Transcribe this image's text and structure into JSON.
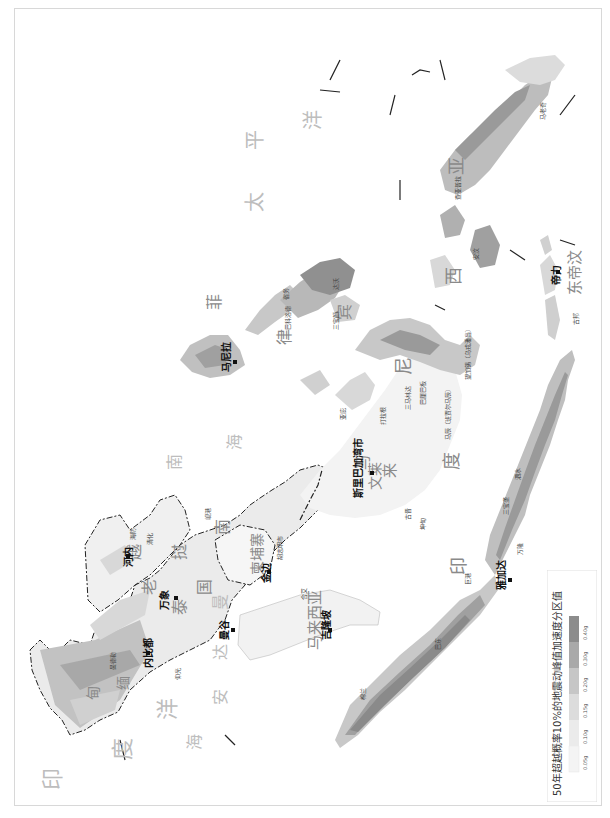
{
  "map": {
    "title": "50年超越概率10%的地震动峰值加速度分区值",
    "orientation": "rotated 90° counter-clockwise",
    "oceans": {
      "pacific": [
        "太",
        "平",
        "洋"
      ],
      "indian": [
        "印",
        "度",
        "洋"
      ],
      "andaman": [
        "安",
        "达",
        "曼",
        "海"
      ],
      "south_china_sea": [
        "南",
        "海"
      ]
    },
    "countries": {
      "vietnam": [
        "越",
        "南"
      ],
      "laos": [
        "老",
        "挝"
      ],
      "thailand": [
        "泰",
        "国"
      ],
      "cambodia": "柬埔寨",
      "myanmar": [
        "缅",
        "甸"
      ],
      "malaysia": "马来西亚",
      "brunei": "文莱",
      "philippines": [
        "菲",
        "律",
        "宾"
      ],
      "indonesia": [
        "印",
        "度",
        "尼",
        "西",
        "亚"
      ],
      "east_timor": "东帝汶",
      "malaysia_borneo": [
        "马",
        "来"
      ]
    },
    "capitals": [
      {
        "name": "内比都"
      },
      {
        "name": "河内"
      },
      {
        "name": "万象"
      },
      {
        "name": "曼谷"
      },
      {
        "name": "金边"
      },
      {
        "name": "吉隆坡"
      },
      {
        "name": "斯里巴加湾市"
      },
      {
        "name": "马尼拉"
      },
      {
        "name": "雅加达"
      },
      {
        "name": "帝力"
      }
    ],
    "cities": [
      {
        "name": "曼德勒"
      },
      {
        "name": "仰光"
      },
      {
        "name": "海防"
      },
      {
        "name": "清化"
      },
      {
        "name": "岘港"
      },
      {
        "name": "胡志明市"
      },
      {
        "name": "合艾"
      },
      {
        "name": "古晋"
      },
      {
        "name": "棉兰"
      },
      {
        "name": "巴东"
      },
      {
        "name": "巨港"
      },
      {
        "name": "泗水"
      },
      {
        "name": "三宝垄"
      },
      {
        "name": "万隆"
      },
      {
        "name": "望加锡（乌戎潘当）"
      },
      {
        "name": "坤甸"
      },
      {
        "name": "马辰（班贾尔马辰）"
      },
      {
        "name": "巴厘巴板"
      },
      {
        "name": "三马林达"
      },
      {
        "name": "达沃"
      },
      {
        "name": "宿务"
      },
      {
        "name": "三宝颜"
      },
      {
        "name": "巴科洛德"
      },
      {
        "name": "安汶"
      },
      {
        "name": "查亚普拉"
      },
      {
        "name": "马老奇"
      },
      {
        "name": "古邦"
      },
      {
        "name": "打拉根"
      },
      {
        "name": "亚庇"
      }
    ]
  },
  "legend": {
    "title": "50年超越概率10%的地震动峰值加速度分区值",
    "items": [
      {
        "label": "0.05g",
        "color": "#f4f4f4"
      },
      {
        "label": "0.10g",
        "color": "#e8e8e8"
      },
      {
        "label": "0.15g",
        "color": "#d8d8d8"
      },
      {
        "label": "0.20g",
        "color": "#c2c2c2"
      },
      {
        "label": "0.30g",
        "color": "#a8a8a8"
      },
      {
        "label": "0.40g",
        "color": "#8a8a8a"
      }
    ]
  },
  "colors": {
    "land_low": "#f4f4f4",
    "land_mid": "#d8d8d8",
    "land_high": "#a8a8a8",
    "land_max": "#8a8a8a",
    "border": "#222222",
    "frame": "#d8d8d8"
  }
}
